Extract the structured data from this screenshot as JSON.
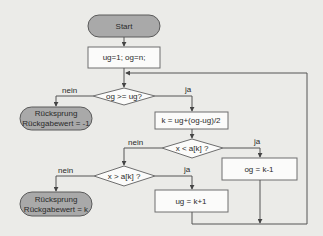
{
  "colors": {
    "background": "#ebebe8",
    "terminal_fill": "#a9a9a9",
    "process_fill": "#fbfbfa",
    "stroke": "#555555"
  },
  "nodes": {
    "start": {
      "type": "terminal",
      "label": "Start"
    },
    "init": {
      "type": "process",
      "label": "ug=1; og=n;"
    },
    "cond_loop": {
      "type": "decision",
      "label": "og >= ug?"
    },
    "return_fail": {
      "type": "terminal",
      "line1": "Rücksprung",
      "line2": "Rückgabewert = -1"
    },
    "calc_k": {
      "type": "process",
      "label": "k = ug+(og-ug)/2"
    },
    "cond_less": {
      "type": "decision",
      "label": "x < a[k] ?"
    },
    "set_og": {
      "type": "process",
      "label": "og = k-1"
    },
    "cond_greater": {
      "type": "decision",
      "label": "x > a[k] ?"
    },
    "return_found": {
      "type": "terminal",
      "line1": "Rücksprung",
      "line2": "Rückgabewert = k"
    },
    "set_ug": {
      "type": "process",
      "label": "ug = k+1"
    }
  },
  "edge_labels": {
    "loop_no": "nein",
    "loop_yes": "ja",
    "less_no": "nein",
    "less_yes": "ja",
    "greater_no": "nein",
    "greater_yes": "ja"
  }
}
